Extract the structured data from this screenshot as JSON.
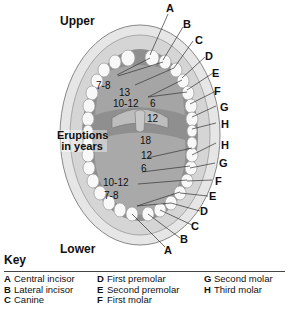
{
  "labels": {
    "upper": "Upper",
    "lower": "Lower",
    "eruptions": [
      "Eruptions",
      "in years"
    ]
  },
  "upper_letters": [
    "A",
    "B",
    "C",
    "D",
    "E",
    "F",
    "G",
    "H"
  ],
  "lower_letters": [
    "H",
    "G",
    "F",
    "E",
    "D",
    "C",
    "B",
    "A"
  ],
  "upper_ages": [
    "7-8",
    "13",
    "10-12",
    "6",
    "12"
  ],
  "lower_ages": [
    "18",
    "12",
    "6",
    "10-12",
    "7-8"
  ],
  "key": {
    "title": "Key",
    "items": [
      {
        "letter": "A",
        "name": "Central incisor"
      },
      {
        "letter": "B",
        "name": "Lateral incisor"
      },
      {
        "letter": "C",
        "name": "Canine"
      },
      {
        "letter": "D",
        "name": "First premolar"
      },
      {
        "letter": "E",
        "name": "Second premolar"
      },
      {
        "letter": "F",
        "name": "First molar"
      },
      {
        "letter": "G",
        "name": "Second molar"
      },
      {
        "letter": "H",
        "name": "Third molar"
      }
    ]
  },
  "colors": {
    "lip": "#e2e2e2",
    "gum": "#cfcfcf",
    "palate": "#9a9a9a",
    "tongue": "#b5b5b5",
    "tooth": "#f7f7f7"
  }
}
